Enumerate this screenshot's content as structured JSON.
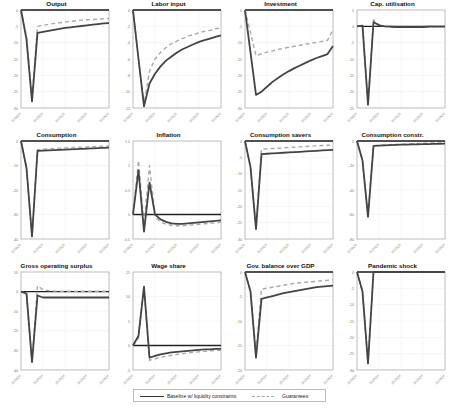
{
  "chart_data": {
    "type": "line",
    "layout": "4x3 small multiples",
    "x": [
      "2019Q4",
      "2020Q1",
      "2020Q2",
      "2020Q3",
      "2020Q4",
      "2021Q1",
      "2021Q2",
      "2021Q3",
      "2021Q4",
      "2022Q1",
      "2022Q2",
      "2022Q3",
      "2022Q4",
      "2023Q1",
      "2023Q2",
      "2023Q3",
      "2023Q4"
    ],
    "xtick_labels": [
      "2019Q4",
      "2020Q4",
      "2021Q4",
      "2022Q4",
      "2023Q4"
    ],
    "legend": {
      "position": "bottom",
      "entries": [
        {
          "name": "Baseline w/ liquidity constraints",
          "style": "solid",
          "color": "#333333"
        },
        {
          "name": "Guarantees",
          "style": "dashed",
          "color": "#aaaaaa"
        }
      ]
    },
    "panels": [
      {
        "title": "Output",
        "ylim": [
          -30,
          0
        ],
        "yticks": [
          0,
          -5,
          -10,
          -15,
          -20,
          -25,
          -30
        ],
        "series": [
          {
            "name": "Baseline w/ liquidity constraints",
            "values": [
              0,
              -9,
              -28,
              -7,
              -6.7,
              -6.4,
              -6.1,
              -5.8,
              -5.5,
              -5.3,
              -5.1,
              -4.9,
              -4.7,
              -4.5,
              -4.3,
              -4.1,
              -4.0
            ]
          },
          {
            "name": "Guarantees",
            "values": [
              0,
              -8,
              -27,
              -5,
              -4.7,
              -4.4,
              -4.1,
              -3.9,
              -3.7,
              -3.5,
              -3.3,
              -3.1,
              -3.0,
              -2.9,
              -2.8,
              -2.7,
              -2.6
            ]
          }
        ]
      },
      {
        "title": "Labor input",
        "ylim": [
          -12,
          0
        ],
        "yticks": [
          0,
          -2,
          -4,
          -6,
          -8,
          -10,
          -12
        ],
        "series": [
          {
            "name": "Baseline w/ liquidity constraints",
            "values": [
              0,
              -6,
              -11.8,
              -9,
              -7.8,
              -6.9,
              -6.2,
              -5.7,
              -5.2,
              -4.8,
              -4.5,
              -4.2,
              -3.9,
              -3.7,
              -3.5,
              -3.3,
              -3.1
            ]
          },
          {
            "name": "Guarantees",
            "values": [
              0,
              -6,
              -11.5,
              -7.5,
              -6.0,
              -5.2,
              -4.6,
              -4.1,
              -3.8,
              -3.5,
              -3.2,
              -3.0,
              -2.8,
              -2.6,
              -2.5,
              -2.3,
              -2.2
            ]
          }
        ]
      },
      {
        "title": "Investment",
        "ylim": [
          -30,
          0
        ],
        "yticks": [
          0,
          -5,
          -10,
          -15,
          -20,
          -25,
          -30
        ],
        "series": [
          {
            "name": "Baseline w/ liquidity constraints",
            "values": [
              0,
              -13,
              -26,
              -25,
              -23.5,
              -22,
              -20.8,
              -19.7,
              -18.7,
              -17.8,
              -17,
              -16.2,
              -15.4,
              -14.7,
              -14.1,
              -13.5,
              -11
            ]
          },
          {
            "name": "Guarantees",
            "values": [
              0,
              -7,
              -14,
              -13.4,
              -12.9,
              -12.5,
              -12.1,
              -11.7,
              -11.4,
              -11.1,
              -10.8,
              -10.5,
              -10.2,
              -9.9,
              -9.6,
              -9.3,
              -6
            ]
          }
        ]
      },
      {
        "title": "Cap. utilisation",
        "ylim": [
          -25,
          5
        ],
        "yticks": [
          5,
          0,
          -5,
          -10,
          -15,
          -20,
          -25
        ],
        "series": [
          {
            "name": "Baseline w/ liquidity constraints",
            "values": [
              0,
              0.2,
              -24,
              1.3,
              0.3,
              0,
              -0.1,
              -0.2,
              -0.2,
              -0.2,
              -0.2,
              -0.2,
              -0.2,
              -0.1,
              -0.1,
              -0.1,
              -0.1
            ]
          },
          {
            "name": "Guarantees",
            "values": [
              0,
              0.2,
              -24,
              2.0,
              0.5,
              0,
              -0.2,
              -0.3,
              -0.3,
              -0.3,
              -0.2,
              -0.2,
              -0.2,
              -0.2,
              -0.1,
              -0.1,
              -0.1
            ]
          }
        ]
      },
      {
        "title": "Consumption",
        "ylim": [
          -40,
          0
        ],
        "yticks": [
          0,
          -10,
          -20,
          -30,
          -40
        ],
        "series": [
          {
            "name": "Baseline w/ liquidity constraints",
            "values": [
              0,
              -11,
              -39,
              -4,
              -3.9,
              -3.8,
              -3.7,
              -3.6,
              -3.5,
              -3.4,
              -3.3,
              -3.2,
              -3.1,
              -3.0,
              -2.9,
              -2.8,
              -2.7
            ]
          },
          {
            "name": "Guarantees",
            "values": [
              0,
              -11,
              -39,
              -3.6,
              -3.4,
              -3.2,
              -3.0,
              -2.9,
              -2.8,
              -2.7,
              -2.6,
              -2.5,
              -2.4,
              -2.3,
              -2.2,
              -2.1,
              -2.0
            ]
          }
        ]
      },
      {
        "title": "Inflation",
        "ylim": [
          -0.5,
          1.5
        ],
        "yticks": [
          1.5,
          1,
          0.5,
          0,
          -0.5
        ],
        "series": [
          {
            "name": "Baseline w/ liquidity constraints",
            "values": [
              0,
              0.9,
              -0.35,
              0.65,
              0,
              -0.1,
              -0.15,
              -0.18,
              -0.19,
              -0.19,
              -0.18,
              -0.17,
              -0.16,
              -0.15,
              -0.14,
              -0.13,
              -0.12
            ]
          },
          {
            "name": "Guarantees",
            "values": [
              0,
              1.1,
              -0.2,
              1.0,
              -0.05,
              -0.15,
              -0.2,
              -0.22,
              -0.23,
              -0.23,
              -0.22,
              -0.21,
              -0.2,
              -0.19,
              -0.18,
              -0.17,
              -0.16
            ]
          }
        ]
      },
      {
        "title": "Consumption savers",
        "ylim": [
          -30,
          0
        ],
        "yticks": [
          0,
          -5,
          -10,
          -15,
          -20,
          -25,
          -30
        ],
        "series": [
          {
            "name": "Baseline w/ liquidity constraints",
            "values": [
              0,
              -8,
              -27,
              -4,
              -3.9,
              -3.8,
              -3.7,
              -3.6,
              -3.5,
              -3.4,
              -3.3,
              -3.2,
              -3.1,
              -3.0,
              -2.9,
              -2.8,
              -2.7
            ]
          },
          {
            "name": "Guarantees",
            "values": [
              0,
              -8,
              -26.5,
              -2.5,
              -2.4,
              -2.3,
              -2.2,
              -2.1,
              -2.0,
              -1.9,
              -1.8,
              -1.7,
              -1.6,
              -1.5,
              -1.4,
              -1.3,
              -1.2
            ]
          }
        ]
      },
      {
        "title": "Consumption constr.",
        "ylim": [
          -80,
          0
        ],
        "yticks": [
          0,
          -20,
          -40,
          -60,
          -80
        ],
        "series": [
          {
            "name": "Baseline w/ liquidity constraints",
            "values": [
              0,
              -16,
              -62,
              -4,
              -3.8,
              -3.6,
              -3.4,
              -3.2,
              -3.0,
              -2.9,
              -2.8,
              -2.7,
              -2.6,
              -2.5,
              -2.4,
              -2.3,
              -2.2
            ]
          },
          {
            "name": "Guarantees",
            "values": [
              0,
              -16,
              -61,
              -3.8,
              -3.5,
              -3.3,
              -3.1,
              -2.9,
              -2.7,
              -2.5,
              -2.3,
              -2.1,
              -1.9,
              -1.7,
              -1.6,
              -1.5,
              -1.4
            ]
          }
        ]
      },
      {
        "title": "Gross operating surplus",
        "ylim": [
          -40,
          10
        ],
        "yticks": [
          10,
          0,
          -10,
          -20,
          -30,
          -40
        ],
        "series": [
          {
            "name": "Baseline w/ liquidity constraints",
            "values": [
              0,
              -1,
              -36,
              -2,
              -3,
              -3,
              -3,
              -3,
              -3,
              -3,
              -3,
              -3,
              -3,
              -3,
              -3,
              -3,
              -3
            ]
          },
          {
            "name": "Guarantees",
            "values": [
              0,
              -1,
              -36,
              3,
              1,
              0.5,
              0.3,
              0.2,
              0.2,
              0.2,
              0.2,
              0.2,
              0.2,
              0.2,
              0.2,
              0.2,
              0.2
            ]
          }
        ]
      },
      {
        "title": "Wage share",
        "ylim": [
          -5,
          15
        ],
        "yticks": [
          15,
          10,
          5,
          0,
          -5
        ],
        "series": [
          {
            "name": "Baseline w/ liquidity constraints",
            "values": [
              0,
              2,
              12,
              -2.5,
              -2.1,
              -1.8,
              -1.6,
              -1.4,
              -1.3,
              -1.2,
              -1.1,
              -1.0,
              -0.9,
              -0.8,
              -0.8,
              -0.7,
              -0.7
            ]
          },
          {
            "name": "Guarantees",
            "values": [
              0,
              1.5,
              12,
              -3,
              -2.7,
              -2.4,
              -2.2,
              -2.0,
              -1.8,
              -1.7,
              -1.5,
              -1.4,
              -1.3,
              -1.2,
              -1.1,
              -1.0,
              -1.0
            ]
          }
        ]
      },
      {
        "title": "Gov. balance over GDP",
        "ylim": [
          -20,
          0
        ],
        "yticks": [
          0,
          -5,
          -10,
          -15,
          -20
        ],
        "series": [
          {
            "name": "Baseline w/ liquidity constraints",
            "values": [
              0,
              -4,
              -17.5,
              -5.5,
              -5.2,
              -4.9,
              -4.6,
              -4.3,
              -4.1,
              -3.9,
              -3.7,
              -3.5,
              -3.3,
              -3.1,
              -3.0,
              -2.9,
              -2.8
            ]
          },
          {
            "name": "Guarantees",
            "values": [
              0,
              -4,
              -16.5,
              -3.5,
              -3.3,
              -3.1,
              -2.9,
              -2.7,
              -2.5,
              -2.3,
              -2.2,
              -2.1,
              -2.0,
              -1.9,
              -1.8,
              -1.7,
              -1.6
            ]
          }
        ]
      },
      {
        "title": "Pandemic shock",
        "ylim": [
          -30,
          0
        ],
        "yticks": [
          0,
          -5,
          -10,
          -15,
          -20,
          -25,
          -30
        ],
        "series": [
          {
            "name": "Baseline w/ liquidity constraints",
            "values": [
              0,
              -6,
              -28,
              0,
              0,
              0,
              0,
              0,
              0,
              0,
              0,
              0,
              0,
              0,
              0,
              0,
              0
            ]
          },
          {
            "name": "Guarantees",
            "values": [
              0,
              -6,
              -28,
              0,
              0,
              0,
              0,
              0,
              0,
              0,
              0,
              0,
              0,
              0,
              0,
              0,
              0
            ]
          }
        ]
      }
    ],
    "grid": true,
    "zero_line": true
  },
  "legend": {
    "baseline_label": "Baseline w/ liquidity constraints",
    "guarantees_label": "Guarantees"
  }
}
